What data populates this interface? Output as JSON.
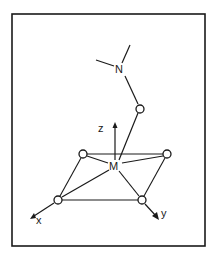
{
  "diagram": {
    "labels": {
      "nitrogen": "N",
      "metal": "M",
      "z_axis": "z",
      "x_axis": "x",
      "y_axis": "y"
    },
    "atoms": [
      {
        "id": "N",
        "label": "N",
        "x": 120,
        "y": 69
      },
      {
        "id": "O_apical",
        "label": "O",
        "x": 140,
        "y": 109
      },
      {
        "id": "M",
        "label": "M",
        "x": 115,
        "y": 165
      },
      {
        "id": "O_tl",
        "label": "O",
        "x": 83,
        "y": 154
      },
      {
        "id": "O_tr",
        "label": "O",
        "x": 167,
        "y": 154
      },
      {
        "id": "O_bl",
        "label": "O",
        "x": 58,
        "y": 200
      },
      {
        "id": "O_br",
        "label": "O",
        "x": 142,
        "y": 200
      }
    ],
    "colors": {
      "line": "#1a1a1a",
      "background": "#ffffff"
    }
  }
}
